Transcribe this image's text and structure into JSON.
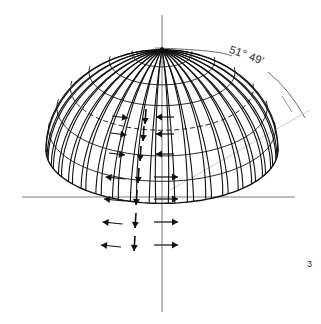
{
  "figure": {
    "angle_label": "51° 49′",
    "figure_number": "3"
  },
  "geometry": {
    "center_x": 162,
    "axis_y": 197,
    "apex_y": 92,
    "radius_x": 116,
    "base_y": 252,
    "meridians": 20,
    "parallels": 7
  },
  "arrows": {
    "down_column": [
      {
        "row": 1,
        "dir": "down"
      },
      {
        "row": 2,
        "dir": "down"
      },
      {
        "row": 3,
        "dir": "down"
      },
      {
        "row": 4,
        "dir": "down"
      },
      {
        "row": 5,
        "dir": "down"
      },
      {
        "row": 6,
        "dir": "down"
      },
      {
        "row": 7,
        "dir": "down"
      }
    ],
    "left_column": [
      {
        "row": 1,
        "dir": "right"
      },
      {
        "row": 2,
        "dir": "right"
      },
      {
        "row": 3,
        "dir": "right"
      },
      {
        "row": 4,
        "dir": "left"
      },
      {
        "row": 5,
        "dir": "left"
      },
      {
        "row": 6,
        "dir": "left"
      },
      {
        "row": 7,
        "dir": "left"
      }
    ],
    "right_column": [
      {
        "row": 1,
        "dir": "left"
      },
      {
        "row": 2,
        "dir": "left"
      },
      {
        "row": 3,
        "dir": "left"
      },
      {
        "row": 4,
        "dir": "right"
      },
      {
        "row": 5,
        "dir": "right"
      },
      {
        "row": 6,
        "dir": "right"
      },
      {
        "row": 7,
        "dir": "right"
      }
    ]
  },
  "colors": {
    "ink": "#111111",
    "axis": "#555555",
    "guide": "#bbbbbb"
  }
}
